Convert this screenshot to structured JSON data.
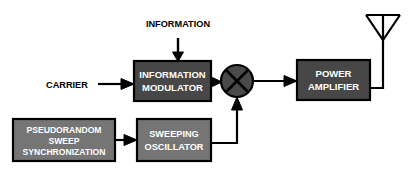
{
  "diagram": {
    "colors": {
      "background": "#ffffff",
      "block_dark_fill": "#474747",
      "block_light_fill": "#757575",
      "block_stroke": "#000000",
      "mixer_fill": "#4a4a4a",
      "label_text": "#ffffff",
      "external_text": "#000000",
      "line": "#000000"
    },
    "blocks": [
      {
        "id": "information-modulator",
        "lines": [
          "INFORMATION",
          "MODULATOR"
        ],
        "shade": "dark",
        "x": 134,
        "y": 61,
        "w": 77,
        "h": 40
      },
      {
        "id": "power-amplifier",
        "lines": [
          "POWER",
          "AMPLIFIER"
        ],
        "shade": "dark",
        "x": 297,
        "y": 60,
        "w": 73,
        "h": 40
      },
      {
        "id": "pseudorandom-sweep-synchronization",
        "lines": [
          "PSEUDORANDOM",
          "SWEEP",
          "SYNCHRONIZATION"
        ],
        "shade": "light",
        "x": 13,
        "y": 119,
        "w": 102,
        "h": 42
      },
      {
        "id": "sweeping-oscillator",
        "lines": [
          "SWEEPING",
          "OSCILLATOR"
        ],
        "shade": "light",
        "x": 137,
        "y": 119,
        "w": 74,
        "h": 42
      }
    ],
    "external_labels": [
      {
        "id": "information",
        "text": "INFORMATION",
        "x": 178,
        "y": 33
      },
      {
        "id": "carrier",
        "text": "CARRIER",
        "x": 72,
        "y": 88
      }
    ],
    "components": [
      {
        "id": "mixer",
        "type": "mixer-circle",
        "cx": 237,
        "cy": 81,
        "r": 16
      },
      {
        "id": "antenna",
        "type": "dipole-antenna",
        "x": 383,
        "y": 12
      }
    ],
    "signal_flow": [
      "INFORMATION (down) → INFORMATION MODULATOR",
      "CARRIER (right) → INFORMATION MODULATOR",
      "INFORMATION MODULATOR → MIXER",
      "PSEUDORANDOM SWEEP SYNCHRONIZATION → SWEEPING OSCILLATOR",
      "SWEEPING OSCILLATOR → (up) MIXER",
      "MIXER → POWER AMPLIFIER",
      "POWER AMPLIFIER → ANTENNA"
    ]
  }
}
